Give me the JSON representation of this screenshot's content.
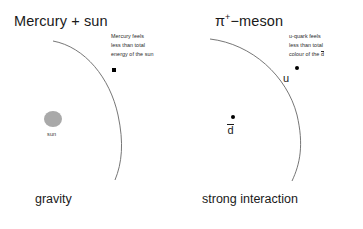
{
  "figure": {
    "width": 363,
    "height": 229,
    "background": "#ffffff",
    "line_color": "#555555",
    "marker_color": "#000000",
    "sun_color": "#a9a9a9",
    "text_color": "#1a1a1a"
  },
  "panels": [
    {
      "id": "gravity-panel",
      "title": "Mercury + sun",
      "title_prefix": "Mercury + sun",
      "title_superscript": "",
      "title_suffix": "",
      "annotation_lines": [
        "Mercury feels",
        "less than total",
        "energy of the sun"
      ],
      "orbit_marker": {
        "name": "mercury",
        "shape": "square",
        "label": ""
      },
      "central_body": {
        "name": "sun",
        "label": "sun",
        "color": "#a9a9a9"
      },
      "caption": "gravity"
    },
    {
      "id": "strong-interaction-panel",
      "title": "π+−meson",
      "title_prefix": "π",
      "title_superscript": "+",
      "title_suffix": "−meson",
      "annotation_lines": [
        "u-quark feels",
        "less than total",
        "colour of the "
      ],
      "annotation_overline_char": "d",
      "orbit_marker": {
        "name": "u-quark",
        "shape": "dot",
        "label": "u"
      },
      "central_body": {
        "name": "anti-down-quark",
        "label_overline": "d",
        "color": "#000000"
      },
      "caption": "strong interaction"
    }
  ]
}
